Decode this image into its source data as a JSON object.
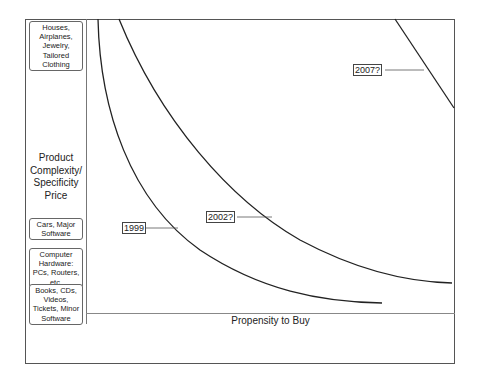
{
  "diagram": {
    "y_axis_label": "Product Complexity/ Specificity Price",
    "x_axis_label": "Propensity to Buy",
    "categories": [
      {
        "label": "Houses, Airplanes, Jewelry, Tailored Clothing"
      },
      {
        "label": "Cars, Major Software"
      },
      {
        "label": "Computer Hardware: PCs, Routers, etc."
      },
      {
        "label": "Books, CDs, Videos, Tickets, Minor Software"
      }
    ],
    "curves": [
      {
        "label": "1999"
      },
      {
        "label": "2002?"
      },
      {
        "label": "2007?"
      }
    ],
    "colors": {
      "line": "#222222",
      "frame": "#555555"
    }
  }
}
